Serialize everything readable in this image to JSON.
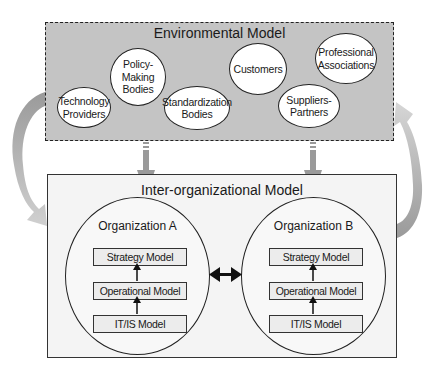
{
  "environmental_model": {
    "title": "Environmental Model",
    "entities": [
      {
        "id": "technology-providers",
        "line1": "Technology",
        "line2": "Providers",
        "line3": ""
      },
      {
        "id": "policy-making-bodies",
        "line1": "Policy-",
        "line2": "Making",
        "line3": "Bodies"
      },
      {
        "id": "standardization-bodies",
        "line1": "Standardization",
        "line2": "Bodies",
        "line3": ""
      },
      {
        "id": "customers",
        "line1": "Customers",
        "line2": "",
        "line3": ""
      },
      {
        "id": "suppliers-partners",
        "line1": "Suppliers-",
        "line2": "Partners",
        "line3": ""
      },
      {
        "id": "professional-associations",
        "line1": "Professional",
        "line2": "Associations",
        "line3": ""
      }
    ]
  },
  "inter_organizational_model": {
    "title": "Inter-organizational Model",
    "organizations": [
      {
        "name": "Organization A",
        "layers": [
          "Strategy Model",
          "Operational Model",
          "IT/IS Model"
        ]
      },
      {
        "name": "Organization B",
        "layers": [
          "Strategy Model",
          "Operational Model",
          "IT/IS Model"
        ]
      }
    ]
  },
  "colors": {
    "env_fill": "#c4c4c4",
    "inter_fill": "#f4f4f4",
    "arrow_gray": "#a8a8a8",
    "stroke": "#222222"
  }
}
